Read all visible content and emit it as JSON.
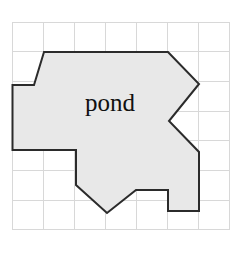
{
  "figure": {
    "title": "",
    "background_color": "#ffffff",
    "canvas": {
      "width": 242,
      "height": 259
    }
  },
  "grid": {
    "columns": 7,
    "rows": 7,
    "origin_x": 12.5,
    "origin_y": 22.0,
    "cell_width": 31.0,
    "cell_height": 29.7,
    "line_color": "#d8d8d8",
    "line_width": 1,
    "visible": true
  },
  "shape": {
    "label": "pond",
    "label_x": 110,
    "label_y": 111,
    "fill_color": "#e8e8e8",
    "stroke_color": "#2b2b2b",
    "stroke_width": 2,
    "vertices_px": [
      [
        44,
        52
      ],
      [
        168,
        52
      ],
      [
        199,
        84
      ],
      [
        169,
        121
      ],
      [
        199,
        152
      ],
      [
        199,
        190
      ],
      [
        168,
        190
      ],
      [
        168,
        211
      ],
      [
        199,
        211
      ],
      [
        199,
        190
      ],
      [
        136,
        190
      ],
      [
        107,
        213
      ],
      [
        76,
        185
      ],
      [
        76,
        150
      ],
      [
        12.5,
        150
      ],
      [
        12.5,
        85
      ],
      [
        34,
        85
      ]
    ],
    "outline_px": [
      [
        44,
        52
      ],
      [
        168,
        52
      ],
      [
        199,
        84
      ],
      [
        169,
        121
      ],
      [
        199,
        152
      ],
      [
        199,
        211
      ],
      [
        168,
        211
      ],
      [
        168,
        190
      ],
      [
        136,
        190
      ],
      [
        107,
        213
      ],
      [
        76,
        185
      ],
      [
        76,
        150
      ],
      [
        12.5,
        150
      ],
      [
        12.5,
        85
      ],
      [
        34,
        85
      ]
    ]
  }
}
